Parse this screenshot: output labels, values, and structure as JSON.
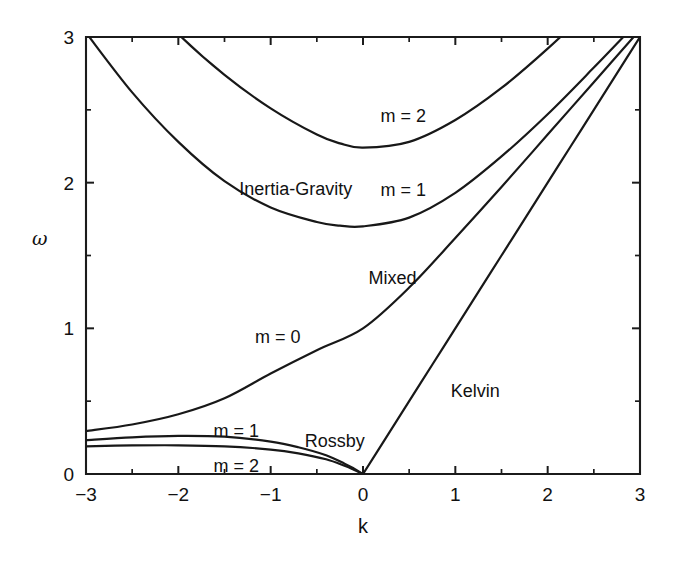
{
  "chart_data": {
    "type": "line",
    "title": "",
    "xlabel": "k",
    "ylabel": "ω",
    "xlim": [
      -3,
      3
    ],
    "ylim": [
      0,
      3
    ],
    "grid": false,
    "legend_position": "inline-annotations",
    "x_ticks": [
      "−3",
      "−2",
      "−1",
      "0",
      "1",
      "2",
      "3"
    ],
    "x_tick_values": [
      -3,
      -2,
      -1,
      0,
      1,
      2,
      3
    ],
    "y_ticks": [
      "0",
      "1",
      "2",
      "3"
    ],
    "y_tick_values": [
      0,
      1,
      2,
      3
    ],
    "x_minor_step": 0.5,
    "y_minor_step": 0.5,
    "series": [
      {
        "name": "Kelvin",
        "label": "Kelvin",
        "x": [
          0.0,
          0.25,
          0.5,
          0.75,
          1.0,
          1.25,
          1.5,
          1.75,
          2.0,
          2.25,
          2.5,
          2.75,
          3.0
        ],
        "y": [
          0.0,
          0.25,
          0.5,
          0.75,
          1.0,
          1.25,
          1.5,
          1.75,
          2.0,
          2.25,
          2.5,
          2.75,
          3.0
        ]
      },
      {
        "name": "mixed-rossby-gravity",
        "label": "Mixed",
        "alt_label": "m = 0",
        "x": [
          -3.0,
          -2.5,
          -2.0,
          -1.5,
          -1.0,
          -0.5,
          0.0,
          0.5,
          1.0,
          1.5,
          2.0,
          2.5,
          3.0
        ],
        "y": [
          0.295,
          0.34,
          0.41,
          0.52,
          0.69,
          0.85,
          1.0,
          1.28,
          1.62,
          1.97,
          2.33,
          2.69,
          3.05
        ]
      },
      {
        "name": "rossby-m1",
        "label": "m = 1",
        "x": [
          -3.0,
          -2.5,
          -2.0,
          -1.5,
          -1.0,
          -0.7,
          -0.4,
          -0.2,
          -0.1,
          0.0
        ],
        "y": [
          0.232,
          0.252,
          0.262,
          0.256,
          0.222,
          0.184,
          0.129,
          0.071,
          0.038,
          0.0
        ]
      },
      {
        "name": "rossby-m2",
        "label": "m = 2",
        "x": [
          -3.0,
          -2.5,
          -2.0,
          -1.5,
          -1.0,
          -0.7,
          -0.4,
          -0.2,
          -0.1,
          0.0
        ],
        "y": [
          0.19,
          0.196,
          0.197,
          0.19,
          0.168,
          0.142,
          0.101,
          0.056,
          0.029,
          0.0
        ]
      },
      {
        "name": "inertia-gravity-m1",
        "label": "m = 1",
        "group_label": "Inertia-Gravity",
        "x": [
          -3.0,
          -2.5,
          -2.0,
          -1.5,
          -1.0,
          -0.5,
          -0.25,
          0.0,
          0.5,
          1.0,
          1.5,
          2.0,
          2.5,
          3.0
        ],
        "y": [
          3.03,
          2.62,
          2.28,
          2.01,
          1.83,
          1.73,
          1.705,
          1.7,
          1.76,
          1.93,
          2.18,
          2.47,
          2.79,
          3.12
        ]
      },
      {
        "name": "inertia-gravity-m2",
        "label": "m = 2",
        "group_label": "Inertia-Gravity",
        "x": [
          -3.0,
          -2.5,
          -2.0,
          -1.5,
          -1.0,
          -0.5,
          -0.25,
          0.0,
          0.5,
          1.0,
          1.5,
          2.0,
          2.5,
          3.0
        ],
        "y": [
          3.74,
          3.36,
          3.02,
          2.74,
          2.51,
          2.33,
          2.27,
          2.24,
          2.28,
          2.43,
          2.65,
          2.92,
          3.22,
          3.54
        ]
      }
    ],
    "annotations": [
      {
        "id": "inertia-gravity",
        "text": "Inertia-Gravity",
        "k": -1.34,
        "omega": 2.02
      },
      {
        "id": "ig-m2",
        "text": "m = 2",
        "k": 0.19,
        "omega": 2.52
      },
      {
        "id": "ig-m1",
        "text": "m = 1",
        "k": 0.19,
        "omega": 2.01
      },
      {
        "id": "mixed",
        "text": "Mixed",
        "k": 0.06,
        "omega": 1.41
      },
      {
        "id": "mrg-m0",
        "text": "m = 0",
        "k": -1.17,
        "omega": 1.0
      },
      {
        "id": "kelvin",
        "text": "Kelvin",
        "k": 0.95,
        "omega": 0.63
      },
      {
        "id": "rossby",
        "text": "Rossby",
        "k": -0.63,
        "omega": 0.29
      },
      {
        "id": "rossby-m1",
        "text": "m = 1",
        "k": -1.62,
        "omega": 0.36
      },
      {
        "id": "rossby-m2",
        "text": "m = 2",
        "k": -1.62,
        "omega": 0.12
      }
    ],
    "colors": {
      "curve": "#181818",
      "axis": "#1b1b1b",
      "text": "#111111",
      "background": "#ffffff"
    }
  }
}
